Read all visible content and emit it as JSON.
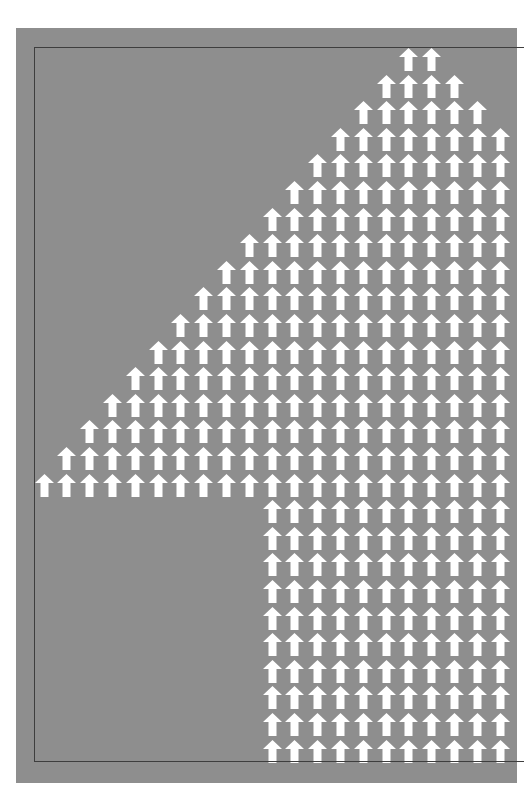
{
  "poster": {
    "background_color": "#8e8e8e",
    "frame_color": "#3e3e3e",
    "arrow_color": "#ffffff",
    "subject": "numeral 4 composed of up arrows",
    "icon": "up-arrow-icon"
  },
  "grid": {
    "columns": 21,
    "rows": 27,
    "col_pitch": 22.8,
    "row_pitch": 26.6,
    "origin_x": 18.5,
    "origin_y": 20,
    "row_ranges": [
      [
        16,
        17
      ],
      [
        15,
        18
      ],
      [
        14,
        19
      ],
      [
        13,
        20
      ],
      [
        12,
        20
      ],
      [
        11,
        20
      ],
      [
        10,
        20
      ],
      [
        9,
        20
      ],
      [
        8,
        20
      ],
      [
        7,
        20
      ],
      [
        6,
        20
      ],
      [
        5,
        20
      ],
      [
        4,
        20
      ],
      [
        3,
        20
      ],
      [
        2,
        20
      ],
      [
        1,
        20
      ],
      [
        0,
        20
      ],
      [
        10,
        20
      ],
      [
        10,
        20
      ],
      [
        10,
        20
      ],
      [
        10,
        20
      ],
      [
        10,
        20
      ],
      [
        10,
        20
      ],
      [
        10,
        20
      ],
      [
        10,
        20
      ],
      [
        10,
        20
      ],
      [
        10,
        20
      ]
    ]
  }
}
